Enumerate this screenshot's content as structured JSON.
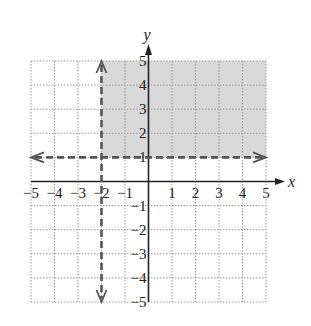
{
  "chart_data": {
    "type": "inequality-region",
    "title": "",
    "xlabel": "x",
    "ylabel": "y",
    "xlim": [
      -5,
      5
    ],
    "ylim": [
      -5,
      5
    ],
    "grid": true,
    "x_ticks": [
      "-5",
      "-4",
      "-3",
      "-2",
      "-1",
      "1",
      "2",
      "3",
      "4",
      "5"
    ],
    "y_ticks": [
      "5",
      "4",
      "3",
      "2",
      "1",
      "-1",
      "-2",
      "-3",
      "-4",
      "-5"
    ],
    "boundary_lines": [
      {
        "equation": "x = -2",
        "style": "dashed",
        "arrows": "both"
      },
      {
        "equation": "y = 1",
        "style": "dashed",
        "arrows": "both"
      }
    ],
    "shaded_region": {
      "description": "x > -2 and y > 1",
      "x_range": [
        -2,
        5
      ],
      "y_range": [
        1,
        5
      ]
    },
    "colors": {
      "shade": "#d9d9d9",
      "boundary": "#555555",
      "grid": "#9a9a9a",
      "axis": "#222222"
    }
  }
}
